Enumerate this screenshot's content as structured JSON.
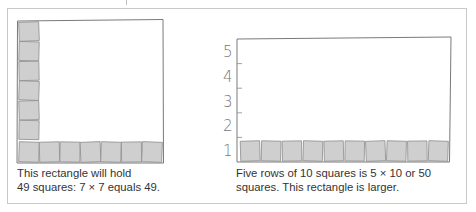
{
  "left_figure": {
    "description": "7 by 7 square rectangle",
    "column_squares": 6,
    "row_squares": 7,
    "caption_line1": "This rectangle will hold",
    "caption_line2": "49 squares: 7 × 7 equals 49."
  },
  "right_figure": {
    "description": "5 by 10 rectangle",
    "row_squares": 10,
    "axis_labels": [
      "1",
      "2",
      "3",
      "4",
      "5"
    ],
    "caption_line1": "Five rows of 10 squares is 5 × 10 or 50",
    "caption_line2": "squares. This rectangle is larger."
  },
  "colors": {
    "square_fill": "#cfcfcf",
    "square_stroke": "#8c8c8c",
    "outline": "#7a7a7a",
    "frame": "#c9c9c9"
  }
}
